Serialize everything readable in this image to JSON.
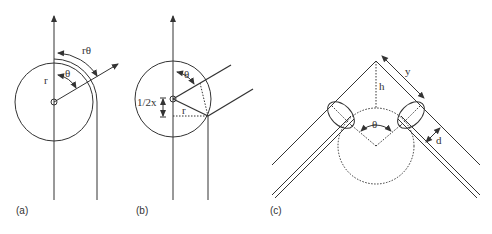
{
  "figure": {
    "stroke_color": "#333333",
    "background": "#ffffff",
    "panels": [
      {
        "id": "a",
        "caption": "(a)",
        "labels": {
          "radius": "r",
          "angle": "θ",
          "arc_length": "rθ"
        }
      },
      {
        "id": "b",
        "caption": "(b)",
        "labels": {
          "angle": "θ",
          "half_offset": "1/2x",
          "radius": "r"
        }
      },
      {
        "id": "c",
        "caption": "(c)",
        "labels": {
          "length": "y",
          "height": "h",
          "angle": "θ",
          "thickness": "d"
        }
      }
    ]
  }
}
